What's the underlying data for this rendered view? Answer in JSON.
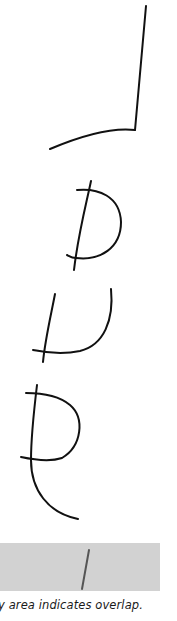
{
  "figure": {
    "glyphs": [
      {
        "name": "glyph-1",
        "description": "vertical stroke with curved base extending left"
      },
      {
        "name": "glyph-2",
        "description": "D-shaped loop crossed by a slanted stroke"
      },
      {
        "name": "glyph-3",
        "description": "U-shaped curve crossed by a slanted stroke"
      },
      {
        "name": "glyph-4",
        "description": "P-shaped loop with a tail curving right"
      }
    ],
    "overlap_band_color": "#d2d2d2",
    "stroke_color": "#111111",
    "caption": "y area indicates overlap."
  }
}
